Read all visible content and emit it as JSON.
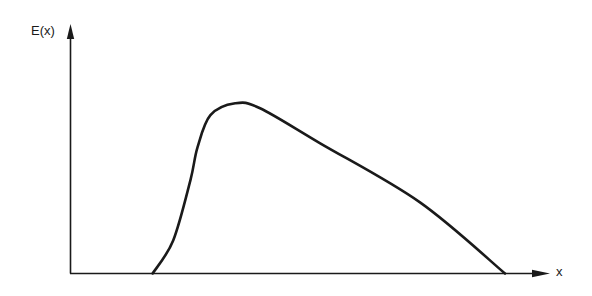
{
  "chart_data": {
    "type": "line",
    "title": "",
    "xlabel": "x",
    "ylabel": "E(x)",
    "xlim": [
      0,
      100
    ],
    "ylim": [
      0,
      100
    ],
    "grid": false,
    "legend": null,
    "ticks": {
      "x": [],
      "y": []
    },
    "units_note": "relative units read from pixel positions; axes have no tick marks",
    "series": [
      {
        "name": "E(x)",
        "x": [
          17.2,
          21.5,
          25.1,
          26.6,
          29.3,
          34.5,
          39.7,
          52.3,
          73.2,
          91.0
        ],
        "y": [
          0,
          13.3,
          37.5,
          50.8,
          63.7,
          68.5,
          66.5,
          52.4,
          28.6,
          0
        ]
      }
    ]
  },
  "labels": {
    "y_axis": "E(x)",
    "x_axis": "x"
  },
  "colors": {
    "ink": "#1a1a1a",
    "background": "#ffffff"
  }
}
